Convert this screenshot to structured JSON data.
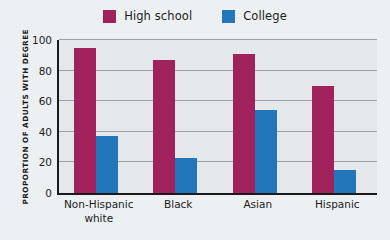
{
  "chart_data": {
    "type": "bar",
    "title": "",
    "xlabel": "",
    "ylabel": "PROPORTION OF ADULTS WITH DEGREE",
    "categories": [
      "Non-Hispanic white",
      "Black",
      "Asian",
      "Hispanic"
    ],
    "category_lines": [
      [
        "Non-Hispanic",
        "white"
      ],
      [
        "Black"
      ],
      [
        "Asian"
      ],
      [
        "Hispanic"
      ]
    ],
    "series": [
      {
        "name": "High school",
        "color": "#a0225a",
        "values": [
          95,
          87,
          91,
          70
        ]
      },
      {
        "name": "College",
        "color": "#2277bb",
        "values": [
          37,
          23,
          54,
          15
        ]
      }
    ],
    "ylim": [
      0,
      100
    ],
    "yticks": [
      0,
      20,
      40,
      60,
      80,
      100
    ],
    "ytick_labels": [
      "0",
      "20",
      "40",
      "60",
      "80",
      "100"
    ],
    "grid": true,
    "legend_position": "top-center"
  },
  "legend": {
    "items": [
      {
        "label": "High school",
        "color": "#a0225a"
      },
      {
        "label": "College",
        "color": "#2277bb"
      }
    ]
  },
  "axis": {
    "y_title": "PROPORTION OF ADULTS WITH DEGREE"
  },
  "colors": {
    "high_school": "#a0225a",
    "college": "#2277bb",
    "background": "#edf0f2",
    "plot_background": "#e4e8eb",
    "axis": "#1a1a1a",
    "gridline": "#9aa2a8"
  }
}
